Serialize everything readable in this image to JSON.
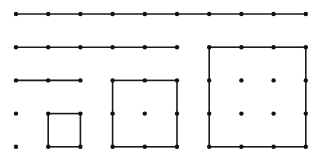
{
  "diagram": {
    "grid": {
      "origin_x": 16,
      "origin_y": 14,
      "step_x": 32.2,
      "step_y": 33.2
    },
    "colors": {
      "stroke": "#1a1a1a",
      "dot": "#111111",
      "background": "#ffffff"
    },
    "segments": [
      {
        "name": "row-10-points",
        "from": [
          0,
          0
        ],
        "to": [
          9,
          0
        ],
        "points": 10
      },
      {
        "name": "row-6-points",
        "from": [
          0,
          1
        ],
        "to": [
          5,
          1
        ],
        "points": 6
      },
      {
        "name": "row-3-points",
        "from": [
          0,
          2
        ],
        "to": [
          2,
          2
        ],
        "points": 3
      }
    ],
    "single_dots": [
      [
        0,
        3
      ],
      [
        0,
        4
      ]
    ],
    "squares": [
      {
        "name": "square-side-1",
        "x0": 1,
        "y0": 3,
        "size": 1
      },
      {
        "name": "square-side-2",
        "x0": 3,
        "y0": 2,
        "size": 2
      },
      {
        "name": "square-side-3",
        "x0": 6,
        "y0": 1,
        "size": 3
      }
    ]
  }
}
